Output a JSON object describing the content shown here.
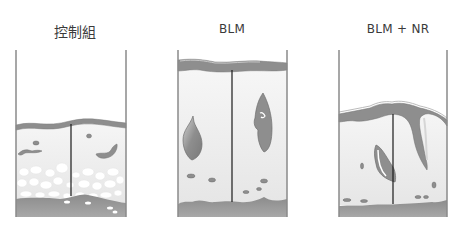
{
  "figure": {
    "type": "three-panel tissue cross-section diagram",
    "panels": [
      {
        "id": "control",
        "label": "控制組",
        "label_x": 45,
        "label_w": 60
      },
      {
        "id": "blm",
        "label": "BLM",
        "label_x": 202,
        "label_w": 60
      },
      {
        "id": "blm_nr",
        "label": "BLM + NR",
        "label_x": 358,
        "label_w": 80
      }
    ],
    "colors": {
      "outline": "#8a8a8a",
      "membrane": "#8e8e8e",
      "membrane_highlight": "#c8c8c8",
      "tissue_fill": "#ececec",
      "base_layer": "#9a9a9a",
      "base_layer_dark": "#858585",
      "cells": "#ffffff",
      "divider": "#1a1a1a",
      "lesion": "#8f8f8f"
    }
  }
}
